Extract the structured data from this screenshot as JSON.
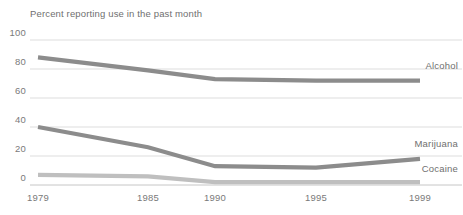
{
  "chart_data": {
    "type": "line",
    "title": "Percent reporting use in the past month",
    "xlabel": "",
    "ylabel": "",
    "x": [
      1979,
      1985,
      1990,
      1995,
      1999
    ],
    "categories": [
      "1979",
      "1985",
      "1990",
      "1995",
      "1999"
    ],
    "xtick_labels": [
      "1979",
      "1985",
      "1990",
      "1995",
      "1999"
    ],
    "ytick_labels": [
      "0",
      "20",
      "40",
      "60",
      "80",
      "100"
    ],
    "yticks": [
      0,
      20,
      40,
      60,
      80,
      100
    ],
    "ylim": [
      0,
      100
    ],
    "xlim": [
      1979,
      1999
    ],
    "grid": "horizontal",
    "legend": "inline-right-of-line-ends",
    "series": [
      {
        "name": "Alcohol",
        "label": "Alcohol",
        "color": "#8c8c8c",
        "values": [
          88,
          79,
          73,
          72,
          72
        ]
      },
      {
        "name": "Marijuana",
        "label": "Marijuana",
        "color": "#8c8c8c",
        "values": [
          40,
          26,
          13,
          12,
          18
        ]
      },
      {
        "name": "Cocaine",
        "label": "Cocaine",
        "color": "#bfbfbf",
        "values": [
          7,
          6,
          2,
          2,
          2
        ]
      }
    ]
  },
  "chart": {
    "title": "Percent reporting use in the past month"
  },
  "colors": {
    "background": "#ffffff",
    "gridline": "#cfcfcf",
    "axisline": "#b8b8b8",
    "text": "#6f6f6f",
    "series_dark": "#8c8c8c",
    "series_light": "#bfbfbf"
  }
}
